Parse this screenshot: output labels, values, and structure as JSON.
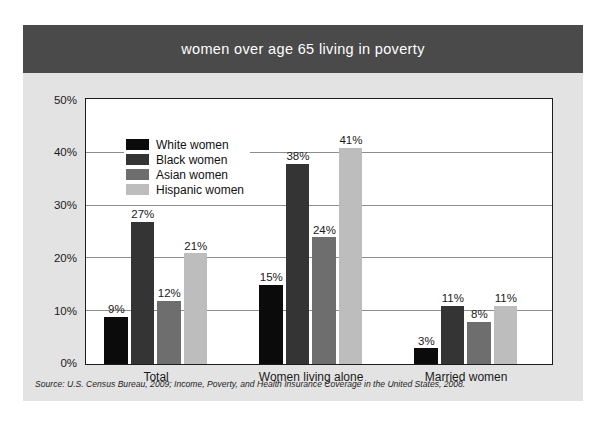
{
  "title": "women over age 65 living in poverty",
  "source_note": "Source: U.S. Census Bureau, 2009; Income, Poverty, and Health Insurance Coverage in the United States, 2008.",
  "colors": {
    "card_background": "#e3e3e3",
    "title_band": "#4a4a4a",
    "title_text": "#ffffff",
    "plot_background": "#ffffff",
    "plot_border": "#1c1c1c",
    "gridline": "#8d8d8d",
    "series": [
      "#0b0b0b",
      "#343434",
      "#6e6e6e",
      "#bdbdbd"
    ]
  },
  "chart_data": {
    "type": "bar",
    "title": "women over age 65 living in poverty",
    "xlabel": "",
    "ylabel": "",
    "ylim": [
      0,
      50
    ],
    "ytick_values": [
      0,
      10,
      20,
      30,
      40,
      50
    ],
    "ytick_labels": [
      "0%",
      "10%",
      "20%",
      "30%",
      "40%",
      "50%"
    ],
    "grid": true,
    "legend_position": "upper-left-inside",
    "value_suffix": "%",
    "categories": [
      "Total",
      "Women living alone",
      "Married women"
    ],
    "series": [
      {
        "name": "White women",
        "color": "#0b0b0b",
        "values": [
          9,
          15,
          3
        ],
        "labels": [
          "9%",
          "15%",
          "3%"
        ]
      },
      {
        "name": "Black women",
        "color": "#343434",
        "values": [
          27,
          38,
          11
        ],
        "labels": [
          "27%",
          "38%",
          "11%"
        ]
      },
      {
        "name": "Asian women",
        "color": "#6e6e6e",
        "values": [
          12,
          24,
          8
        ],
        "labels": [
          "12%",
          "24%",
          "8%"
        ]
      },
      {
        "name": "Hispanic women",
        "color": "#bdbdbd",
        "values": [
          21,
          41,
          11
        ],
        "labels": [
          "21%",
          "41%",
          "11%"
        ]
      }
    ]
  }
}
